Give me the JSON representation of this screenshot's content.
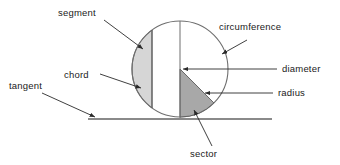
{
  "figure": {
    "background_color": "#ffffff",
    "stroke_color": "#3a3a3a",
    "text_color": "#1a1a1a",
    "segment_fill": "#d4d4d4",
    "sector_fill": "#a8a8a8",
    "tangent_color": "#8a8a8a"
  },
  "labels": {
    "segment": "segment",
    "chord": "chord",
    "tangent": "tangent",
    "circumference": "circumference",
    "diameter": "diameter",
    "radius": "radius",
    "sector": "sector"
  },
  "geometry": {
    "circle": {
      "cx": 180,
      "cy": 69,
      "r": 48
    },
    "chord_x": 152,
    "diameter_y": 69,
    "tangent_y": 119,
    "tangent_x1": 88,
    "tangent_x2": 272
  }
}
